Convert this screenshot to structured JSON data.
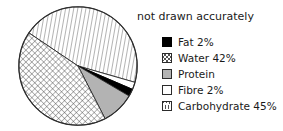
{
  "caption": "not drawn accurately",
  "chart_data": {
    "type": "pie",
    "title": "",
    "note": "not drawn accurately",
    "legend_position": "right",
    "grid": false,
    "categories": [
      "Fat",
      "Water",
      "Protein",
      "Fibre",
      "Carbohydrate"
    ],
    "values": [
      2,
      42,
      9,
      2,
      45
    ],
    "labels": [
      "Fat 2%",
      "Water 42%",
      "Protein",
      "Fibre 2%",
      "Carbohydrate 45%"
    ],
    "value_labels": [
      "2%",
      "42%",
      "",
      "2%",
      "45%"
    ],
    "units": "percent",
    "slices": [
      {
        "name": "Carbohydrate",
        "label": "Carbohydrate 45%",
        "value": 45,
        "pattern": "diagonal-lines",
        "fill": "#ffffff",
        "stroke": "#2b2b2b",
        "start_angle": 214,
        "end_angle": 376
      },
      {
        "name": "Fibre",
        "label": "Fibre 2%",
        "value": 2,
        "pattern": "solid-white",
        "fill": "#ffffff",
        "stroke": "#2b2b2b",
        "start_angle": 376,
        "end_angle": 383.2
      },
      {
        "name": "Fat",
        "label": "Fat 2%",
        "value": 2,
        "pattern": "solid-black",
        "fill": "#000000",
        "stroke": "#000000",
        "start_angle": 383.2,
        "end_angle": 390.4
      },
      {
        "name": "Protein",
        "label": "Protein",
        "value": 9,
        "pattern": "solid-gray",
        "fill": "#b3b3b3",
        "stroke": "#2b2b2b",
        "start_angle": 390.4,
        "end_angle": 422.8
      },
      {
        "name": "Water",
        "label": "Water 42%",
        "value": 42,
        "pattern": "cross-hatch",
        "fill": "#ffffff",
        "stroke": "#2b2b2b",
        "start_angle": 422.8,
        "end_angle": 574
      }
    ]
  },
  "legend": {
    "items": [
      {
        "label": "Fat 2%",
        "swatch": "solid-black",
        "swatch_name": "legend-swatch-fat"
      },
      {
        "label": "Water 42%",
        "swatch": "cross-hatch",
        "swatch_name": "legend-swatch-water"
      },
      {
        "label": "Protein",
        "swatch": "solid-gray",
        "swatch_name": "legend-swatch-protein"
      },
      {
        "label": "Fibre 2%",
        "swatch": "solid-white",
        "swatch_name": "legend-swatch-fibre"
      },
      {
        "label": "Carbohydrate 45%",
        "swatch": "diagonal",
        "swatch_name": "legend-swatch-carbohydrate"
      }
    ]
  },
  "colors": {
    "fat": "#000000",
    "protein": "#b3b3b3",
    "outline": "#2b2b2b",
    "background": "#ffffff",
    "hatch": "#555555"
  }
}
